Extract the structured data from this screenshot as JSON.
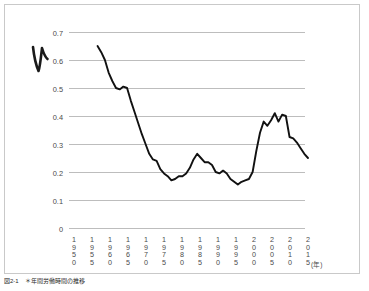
{
  "figure": {
    "caption": "図2-1　＊年間労働時間の推移",
    "annotation": {
      "name": "handwritten-check-mark",
      "glyph": "V"
    },
    "frame_color": "#c9c9c9"
  },
  "chart_data": {
    "type": "line",
    "title": "",
    "xlabel": "",
    "ylabel": "",
    "x_unit": "(年)",
    "ylim": [
      0,
      0.7
    ],
    "xlim": [
      1950,
      2015
    ],
    "grid": true,
    "legend": null,
    "line_color": "#111111",
    "y_ticks": [
      "0.7",
      "0.6",
      "0.5",
      "0.4",
      "0.3",
      "0.2",
      "0.1",
      "0"
    ],
    "y_tick_values": [
      0.7,
      0.6,
      0.5,
      0.4,
      0.3,
      0.2,
      0.1,
      0
    ],
    "x_ticks": [
      "1950",
      "1955",
      "1960",
      "1965",
      "1970",
      "1975",
      "1980",
      "1985",
      "1990",
      "1995",
      "2000",
      "2005",
      "2010",
      "2015"
    ],
    "x_tick_values": [
      1950,
      1955,
      1960,
      1965,
      1970,
      1975,
      1980,
      1985,
      1990,
      1995,
      2000,
      2005,
      2010,
      2015
    ],
    "series": [
      {
        "name": "value",
        "x": [
          1958,
          1959,
          1960,
          1961,
          1962,
          1963,
          1964,
          1965,
          1966,
          1967,
          1968,
          1969,
          1970,
          1971,
          1972,
          1973,
          1974,
          1975,
          1976,
          1977,
          1978,
          1979,
          1980,
          1981,
          1982,
          1983,
          1984,
          1985,
          1986,
          1987,
          1988,
          1989,
          1990,
          1991,
          1992,
          1993,
          1994,
          1995,
          1996,
          1997,
          1998,
          1999,
          2000,
          2001,
          2002,
          2003,
          2004,
          2005,
          2006,
          2007,
          2008,
          2009,
          2010,
          2011,
          2012,
          2013,
          2014,
          2015
        ],
        "values": [
          0.65,
          0.628,
          0.6,
          0.555,
          0.525,
          0.5,
          0.495,
          0.505,
          0.5,
          0.455,
          0.415,
          0.375,
          0.335,
          0.3,
          0.265,
          0.245,
          0.24,
          0.21,
          0.195,
          0.185,
          0.17,
          0.175,
          0.185,
          0.185,
          0.195,
          0.215,
          0.245,
          0.265,
          0.25,
          0.235,
          0.235,
          0.225,
          0.2,
          0.195,
          0.205,
          0.195,
          0.175,
          0.165,
          0.155,
          0.165,
          0.17,
          0.175,
          0.2,
          0.275,
          0.34,
          0.38,
          0.365,
          0.385,
          0.41,
          0.38,
          0.405,
          0.4,
          0.325,
          0.32,
          0.305,
          0.285,
          0.265,
          0.25
        ]
      }
    ]
  }
}
